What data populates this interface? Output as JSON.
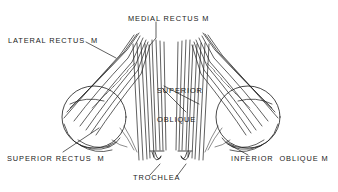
{
  "figure": {
    "kind": "anatomical-line-drawing",
    "ink_color": "#1b1b1b",
    "background_color": "#ffffff"
  },
  "labels": {
    "lateral_rectus": "LATERAL RECTUS  M",
    "medial_rectus": "MEDIAL RECTUS M",
    "superior_oblique_line1": "SUPERIOR",
    "superior_oblique_line2": "OBLIQUE",
    "superior_rectus": "SUPERIOR RECTUS  M",
    "trochlea": "TROCHLEA",
    "inferior_oblique": "INFERIOR  OBLIQUE M"
  }
}
